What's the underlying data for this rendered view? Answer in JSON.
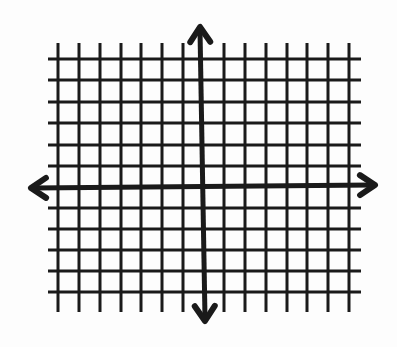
{
  "diagram": {
    "type": "coordinate-plane",
    "background": "#fdfdfd",
    "line_color": "#1a1a1a",
    "grid": {
      "vertical_lines_x": [
        58,
        79,
        100,
        121,
        141,
        162,
        183,
        224,
        245,
        266,
        287,
        307,
        328,
        349
      ],
      "vertical_top": 43,
      "vertical_bottom": 312,
      "horizontal_lines_y": [
        59,
        80,
        102,
        123,
        145,
        166,
        208,
        229,
        250,
        271,
        292
      ],
      "horizontal_left": 48,
      "horizontal_right": 361,
      "line_width": 3
    },
    "x_axis": {
      "start": [
        31,
        188
      ],
      "end": [
        375,
        185
      ],
      "width": 5,
      "arrowheads": [
        "left",
        "right"
      ]
    },
    "y_axis": {
      "start": [
        200,
        27
      ],
      "end": [
        205,
        321
      ],
      "width": 5,
      "arrowheads": [
        "up",
        "down"
      ]
    },
    "columns_left_of_y_axis": 7,
    "columns_right_of_y_axis": 7,
    "rows_above_x_axis": 6,
    "rows_below_x_axis": 5
  }
}
